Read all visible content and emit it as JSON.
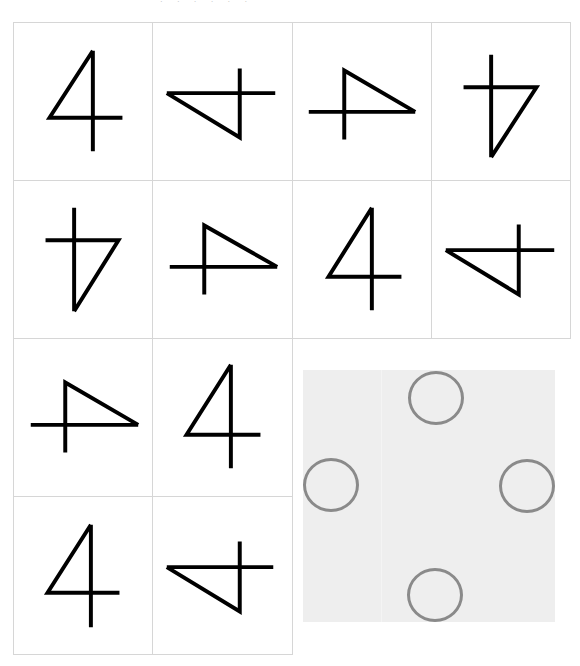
{
  "header": {
    "fragment": "· · · · · ·"
  },
  "grid": {
    "line_color": "#d6d6d6",
    "stroke_color": "#000000",
    "cells": [
      {
        "row": 0,
        "col": 0,
        "glyph": "4",
        "rotation": 0
      },
      {
        "row": 0,
        "col": 1,
        "glyph": "4",
        "rotation": 270
      },
      {
        "row": 0,
        "col": 2,
        "glyph": "4",
        "rotation": 90
      },
      {
        "row": 0,
        "col": 3,
        "glyph": "4",
        "rotation": 180
      },
      {
        "row": 1,
        "col": 0,
        "glyph": "4",
        "rotation": 180
      },
      {
        "row": 1,
        "col": 1,
        "glyph": "4",
        "rotation": 90
      },
      {
        "row": 1,
        "col": 2,
        "glyph": "4",
        "rotation": 0
      },
      {
        "row": 1,
        "col": 3,
        "glyph": "4",
        "rotation": 270
      },
      {
        "row": 2,
        "col": 0,
        "glyph": "4",
        "rotation": 90
      },
      {
        "row": 2,
        "col": 1,
        "glyph": "4",
        "rotation": 0
      },
      {
        "row": 3,
        "col": 0,
        "glyph": "4",
        "rotation": 0
      },
      {
        "row": 3,
        "col": 1,
        "glyph": "4",
        "rotation": 270
      }
    ]
  },
  "answer_panel": {
    "background": "#eeeeee",
    "circle_color": "#8a8a8a",
    "slots": [
      {
        "position": "top"
      },
      {
        "position": "left"
      },
      {
        "position": "right"
      },
      {
        "position": "bottom"
      }
    ]
  }
}
